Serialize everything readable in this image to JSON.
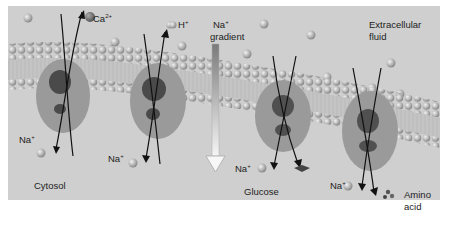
{
  "figure": {
    "regions": {
      "extracellular": "Extracellular\nfluid",
      "extracellular_line1": "Extracellular",
      "extracellular_line2": "fluid",
      "cytosol": "Cytosol"
    },
    "gradient": {
      "ion": "Na",
      "charge": "+",
      "label": "gradient",
      "direction": "down"
    },
    "transporters": [
      {
        "id": 1,
        "type": "antiporter",
        "moves_in": {
          "ion": "Na",
          "charge": "+"
        },
        "moves_out": {
          "ion": "Ca",
          "charge": "2+"
        }
      },
      {
        "id": 2,
        "type": "antiporter",
        "moves_in": {
          "ion": "Na",
          "charge": "+"
        },
        "moves_out": {
          "ion": "H",
          "charge": "+"
        }
      },
      {
        "id": 3,
        "type": "symporter",
        "moves_in": [
          {
            "ion": "Na",
            "charge": "+"
          },
          {
            "solute": "Glucose"
          }
        ]
      },
      {
        "id": 4,
        "type": "symporter",
        "moves_in": [
          {
            "ion": "Na",
            "charge": "+"
          },
          {
            "solute": "Amino acid"
          }
        ]
      }
    ],
    "labels": {
      "ca": "Ca",
      "ca_charge": "2+",
      "h": "H",
      "h_charge": "+",
      "na": "Na",
      "na_charge": "+",
      "glucose": "Glucose",
      "amino_line1": "Amino",
      "amino_line2": "acid"
    }
  }
}
